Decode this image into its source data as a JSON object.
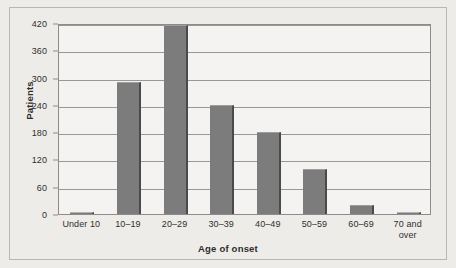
{
  "chart_data": {
    "type": "bar",
    "title": "",
    "xlabel": "Age of onset",
    "ylabel": "Patients",
    "categories": [
      "Under 10",
      "10–19",
      "20–29",
      "30–39",
      "40–49",
      "50–59",
      "60–69",
      "70 and over"
    ],
    "values": [
      2,
      290,
      415,
      240,
      180,
      100,
      20,
      3
    ],
    "ylim": [
      0,
      420
    ],
    "yticks": [
      0,
      60,
      120,
      180,
      240,
      300,
      360,
      420
    ],
    "ytick_labels": [
      "0",
      "60",
      "120",
      "180",
      "240",
      "300",
      "360",
      "420"
    ],
    "grid": "horizontal",
    "legend": "none",
    "bar_color": "#7c7c7c",
    "bar_edge_color": "#4a4a4a",
    "plot_background": "#f4f3f1",
    "figure_background": "#eeece9",
    "gridline_color": "#9a9894",
    "axis_color": "#8e8c88",
    "text_color": "#2f2f2f"
  },
  "xtick_lines": [
    [
      "Under 10"
    ],
    [
      "10–19"
    ],
    [
      "20–29"
    ],
    [
      "30–39"
    ],
    [
      "40–49"
    ],
    [
      "50–59"
    ],
    [
      "60–69"
    ],
    [
      "70 and",
      "over"
    ]
  ]
}
